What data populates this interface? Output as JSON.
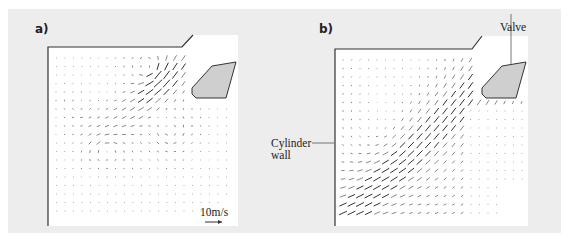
{
  "figure": {
    "panels": [
      {
        "id": "a",
        "label": "a)",
        "flow": "swirl"
      },
      {
        "id": "b",
        "label": "b)",
        "flow": "tumble"
      }
    ],
    "annotations": {
      "valve": "Valve",
      "cylinder_wall_line1": "Cylinder",
      "cylinder_wall_line2": "wall"
    },
    "scale": {
      "label": "10m/s",
      "value_m_per_s": 10
    },
    "colors": {
      "background": "#ededed",
      "plot": "#ffffff",
      "valve_fill": "#cfcfcf",
      "outline": "#333333",
      "arrow": "#555555"
    }
  }
}
